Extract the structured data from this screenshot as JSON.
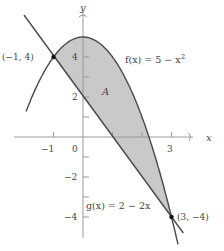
{
  "figure": {
    "axes": {
      "x_label": "x",
      "y_label": "y",
      "x_ticks": [
        {
          "value": -1,
          "label": "−1"
        },
        {
          "value": 1,
          "label": ""
        },
        {
          "value": 2,
          "label": ""
        },
        {
          "value": 3,
          "label": "3"
        }
      ],
      "origin_label": "0",
      "y_ticks": [
        {
          "value": 1,
          "label": ""
        },
        {
          "value": 2,
          "label": "2"
        },
        {
          "value": 3,
          "label": ""
        },
        {
          "value": 4,
          "label": "4"
        },
        {
          "value": -1,
          "label": ""
        },
        {
          "value": -2,
          "label": "−2"
        },
        {
          "value": -3,
          "label": ""
        },
        {
          "value": -4,
          "label": "−4"
        }
      ]
    },
    "curves": [
      {
        "name": "f",
        "label": "f(x) = 5 − x",
        "exponent": "2",
        "expression": "5 - x^2"
      },
      {
        "name": "g",
        "label": "g(x) = 2 − 2x",
        "expression": "2 - 2x"
      }
    ],
    "region_label": "A",
    "points": [
      {
        "label": "(−1, 4)",
        "x": -1,
        "y": 4
      },
      {
        "label": "(3, −4)",
        "x": 3,
        "y": -4
      }
    ],
    "colors": {
      "fill": "#c9c9c9",
      "curve": "#4a4a4a",
      "axis": "#9a9a9a",
      "text": "#444444"
    }
  }
}
